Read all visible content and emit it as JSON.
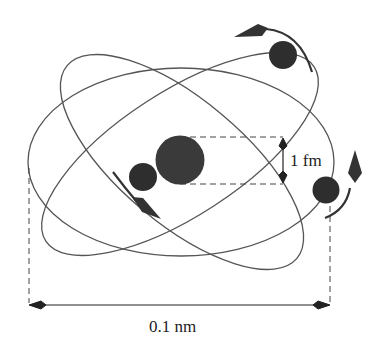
{
  "diagram": {
    "colors": {
      "background": "#ffffff",
      "orbit": "#555555",
      "particle": "#2e2e2e",
      "nucleus": "#3a3a3a",
      "dimension_line": "#222222"
    },
    "nucleus": {
      "label": "nucleus",
      "size_label": "1 fm"
    },
    "electrons": [
      {
        "id": "electron-left",
        "motion": "down-right arrow"
      },
      {
        "id": "electron-top-right",
        "motion": "counter-clockwise arrow"
      },
      {
        "id": "electron-right",
        "motion": "upward arrow"
      }
    ],
    "orbits": 3,
    "dimensions": {
      "nucleus_diameter": "1 fm",
      "atom_diameter": "0.1 nm"
    }
  }
}
